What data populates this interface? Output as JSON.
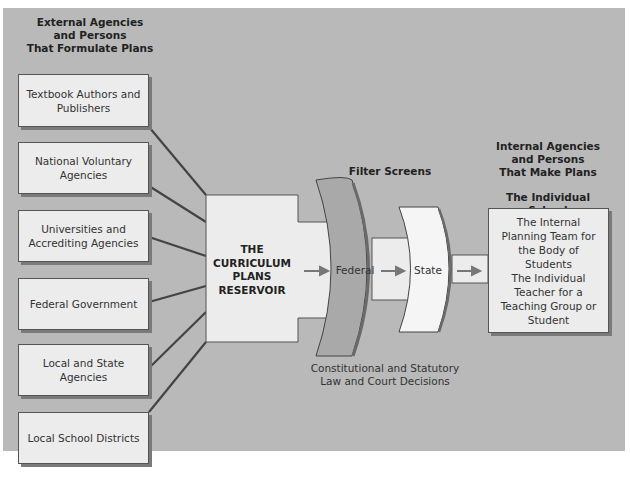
{
  "left_header": [
    "External Agencies",
    "and Persons",
    "That Formulate Plans"
  ],
  "external_agencies": [
    "Textbook Authors and Publishers",
    "National Voluntary Agencies",
    "Universities and Accrediting Agencies",
    "Federal Government",
    "Local and State Agencies",
    "Local School Districts"
  ],
  "reservoir": [
    "THE",
    "CURRICULUM",
    "PLANS",
    "RESERVOIR"
  ],
  "filter_screens_title": "Filter Screens",
  "filters": {
    "federal": "Federal",
    "state": "State"
  },
  "filter_caption": [
    "Constitutional and Statutory",
    "Law and Court Decisions"
  ],
  "right_header": [
    "Internal Agencies",
    "and Persons",
    "That Make Plans"
  ],
  "school_title": "The Individual School",
  "school_items": [
    "The Internal Planning Team for the Body of Students",
    "The Individual Teacher for a Teaching Group or Student"
  ]
}
